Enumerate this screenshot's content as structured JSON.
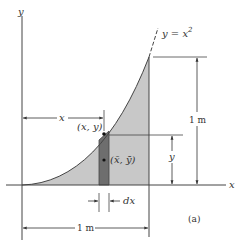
{
  "figure": {
    "subfigure_label": "(a)",
    "axes": {
      "x_label": "x",
      "y_label": "y"
    },
    "curve_label": "y = x",
    "curve_exponent": "2",
    "point_label": "(x, y)",
    "centroid_label": "(x̄, ȳ)",
    "dims": {
      "x_dim": "x",
      "y_dim": "y",
      "dx_dim": "dx",
      "height_dim": "1 m",
      "width_dim": "1 m"
    },
    "colors": {
      "region_fill": "#c8c8c8",
      "strip_fill": "#6e6e6e",
      "line": "#444444"
    }
  }
}
